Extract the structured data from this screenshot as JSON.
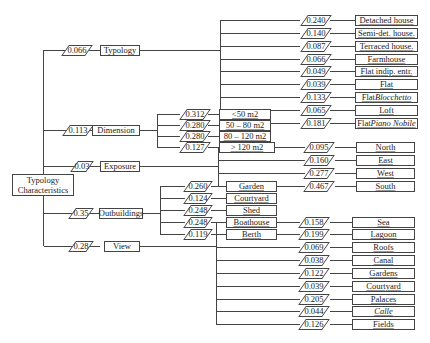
{
  "root": {
    "line1": "Typology",
    "line2": "Characteristics"
  },
  "categories": [
    {
      "label": "Typology",
      "weight": "0.066"
    },
    {
      "label": "Dimension",
      "weight": "0.113"
    },
    {
      "label": "Exposure",
      "weight": "0.03"
    },
    {
      "label": "Outbuildings",
      "weight": "0.35"
    },
    {
      "label": "View",
      "weight": "0.28"
    }
  ],
  "typology": [
    {
      "label": "Detached house",
      "weight": "0.240"
    },
    {
      "label": "Semi-det. house.",
      "weight": "0.140"
    },
    {
      "label": "Terraced house.",
      "weight": "0.087"
    },
    {
      "label": "Farmhouse",
      "weight": "0.066"
    },
    {
      "label": "Flat indip. entr.",
      "weight": "0.049"
    },
    {
      "label": "Flat",
      "weight": "0.039"
    },
    {
      "label_prefix": "Flat ",
      "label_italic": "Blocchetto",
      "weight": "0.133"
    },
    {
      "label": "Loft",
      "weight": "0.065"
    },
    {
      "label_prefix": "Flat ",
      "label_italic": "Piano Nobile",
      "weight": "0.181"
    }
  ],
  "dimension": [
    {
      "label": "<50 m2",
      "weight": "0.312"
    },
    {
      "label": "50 – 80 m2",
      "weight": "0.280"
    },
    {
      "label": "80 – 120 m2",
      "weight": "0.280"
    },
    {
      "label": "> 120 m2",
      "weight": "0.127"
    }
  ],
  "exposure": [
    {
      "label": "North",
      "weight": "0.095"
    },
    {
      "label": "East",
      "weight": "0.160"
    },
    {
      "label": "West",
      "weight": "0.277"
    },
    {
      "label": "South",
      "weight": "0.467"
    }
  ],
  "outbuildings": [
    {
      "label": "Garden",
      "weight": "0.260"
    },
    {
      "label": "Courtyard",
      "weight": "0.124"
    },
    {
      "label": "Shed",
      "weight": "0.248"
    },
    {
      "label": "Boathouse",
      "weight": "0.248"
    },
    {
      "label": "Berth",
      "weight": "0.119"
    }
  ],
  "view": [
    {
      "label": "Sea",
      "weight": "0.158"
    },
    {
      "label": "Lagoon",
      "weight": "0.199"
    },
    {
      "label": "Roofs",
      "weight": "0.069"
    },
    {
      "label": "Canal",
      "weight": "0.038"
    },
    {
      "label": "Gardens",
      "weight": "0.122"
    },
    {
      "label": "Courtyard",
      "weight": "0.039"
    },
    {
      "label": "Palaces",
      "weight": "0.205"
    },
    {
      "label": "Calle",
      "weight": "0.044",
      "italic": true
    },
    {
      "label": "Fields",
      "weight": "0.126"
    }
  ]
}
